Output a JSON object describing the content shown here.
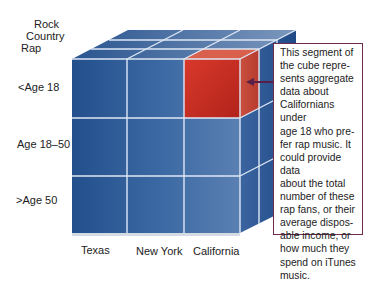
{
  "diagram": {
    "type": "data-cube",
    "genre_axis": [
      "Rock",
      "Country",
      "Rap"
    ],
    "age_axis": [
      "<Age 18",
      "Age 18–50",
      ">Age 50"
    ],
    "state_axis": [
      "Texas",
      "New York",
      "California"
    ],
    "highlighted_cell": {
      "state": "California",
      "age": "<Age 18",
      "genre": "Rap"
    },
    "colors": {
      "cube_blue": "#2b5894",
      "cube_light": "#6d8fb9",
      "highlight_red": "#c8281e",
      "callout_border": "#6e2b4b",
      "arrow": "#5a1f46"
    },
    "callout_text": "This segment of the cube represents aggregate data about Californians under age 18 who prefer rap music. It could provide data about the total number of these rap fans, or their average disposable income, or how much they spend on iTunes music.",
    "callout_lines": [
      "This segment of",
      "the cube repre-",
      "sents aggregate",
      "data about",
      "Californians under",
      "age 18 who pre-",
      "fer rap music. It",
      "could provide data",
      "about the total",
      "number of these",
      "rap fans, or their",
      "average dispos-",
      "able income, or",
      "how much they",
      "spend on iTunes",
      "music."
    ]
  }
}
